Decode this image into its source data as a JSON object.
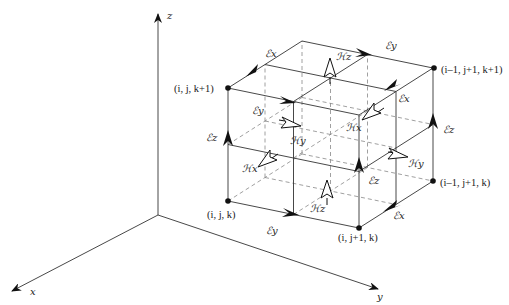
{
  "axes": {
    "x": "x",
    "y": "y",
    "z": "z"
  },
  "nodes": {
    "ijk": "(i, j, k)",
    "ijk1": "(i, j, k+1)",
    "ij1k": "(i, j+1, k)",
    "im1j1k": "(i–1, j+1, k)",
    "im1j1k1": "(i–1, j+1, k+1)"
  },
  "fields": {
    "Ex": "ℰx",
    "Ey": "ℰy",
    "Ez": "ℰz",
    "Hx": "ℋx",
    "Hy": "ℋy",
    "Hz": "ℋz"
  },
  "labels": [
    {
      "id": "ex_top_left",
      "text": "ℰx"
    },
    {
      "id": "ey_top_right",
      "text": "ℰy"
    },
    {
      "id": "ey_front_top",
      "text": "ℰy"
    },
    {
      "id": "ex_right_top",
      "text": "ℰx"
    },
    {
      "id": "ez_left",
      "text": "ℰz"
    },
    {
      "id": "ez_right",
      "text": "ℰz"
    },
    {
      "id": "ez_mid",
      "text": "ℰz"
    },
    {
      "id": "ey_bottom",
      "text": "ℰy"
    },
    {
      "id": "ex_bottom_right",
      "text": "ℰx"
    },
    {
      "id": "hz_top",
      "text": "ℋz"
    },
    {
      "id": "hz_bottom",
      "text": "ℋz"
    },
    {
      "id": "hy_front",
      "text": "ℋy"
    },
    {
      "id": "hy_right",
      "text": "ℋy"
    },
    {
      "id": "hx_front",
      "text": "ℋx"
    },
    {
      "id": "hx_right",
      "text": "ℋx"
    }
  ]
}
